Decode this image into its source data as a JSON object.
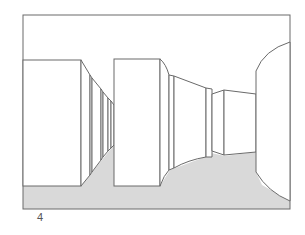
{
  "figure": {
    "label": "4",
    "colors": {
      "stroke": "#6a6a6a",
      "floor": "#d9d9d9",
      "wall": "#ffffff",
      "background": "#ffffff"
    }
  }
}
